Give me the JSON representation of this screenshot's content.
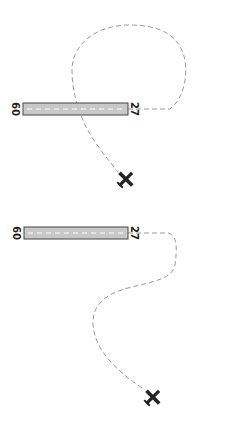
{
  "diagrams": [
    {
      "id": "diagram-1",
      "runway": {
        "left_label": "09",
        "right_label": "27",
        "fill": "#c8c8c8",
        "stroke": "#555555",
        "centerline": "#ffffff"
      },
      "path": {
        "description": "Aircraft path from runway 27 end, looping north (up) and around, crossing runway to aircraft position",
        "stroke": "#9a9a9a"
      },
      "aircraft": {
        "icon": "airplane-icon",
        "color": "#222222"
      }
    },
    {
      "id": "diagram-2",
      "runway": {
        "left_label": "09",
        "right_label": "27",
        "fill": "#c8c8c8",
        "stroke": "#555555",
        "centerline": "#ffffff"
      },
      "path": {
        "description": "Aircraft path from runway 27 end, S-curve south to aircraft position",
        "stroke": "#9a9a9a"
      },
      "aircraft": {
        "icon": "airplane-icon",
        "color": "#222222"
      }
    }
  ]
}
